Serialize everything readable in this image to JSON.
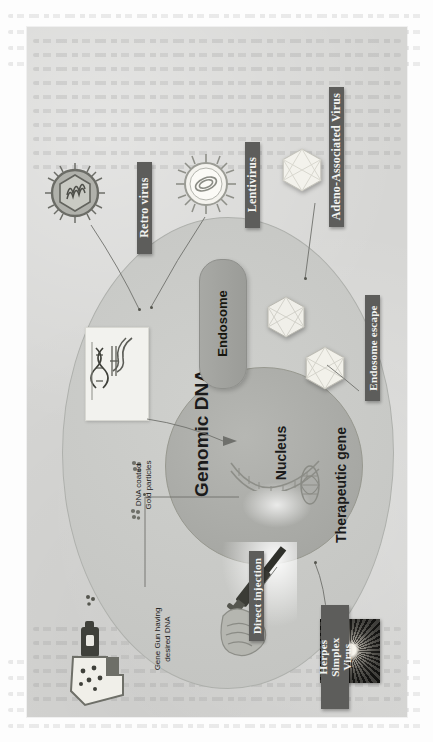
{
  "figure": {
    "orientation": "rotated-90-ccw",
    "background_note": "scanned book page with faint bleed-through text",
    "colors": {
      "page": "#fdfdfd",
      "panel": "#d6d6d4",
      "cell": "#c8c9c6",
      "nucleus": "#a9aaa6",
      "endosome": "#9b9c98",
      "ribbon": "#5d5d5b",
      "ribbon_text": "#f3f3f1",
      "ink": "#1b1b1b"
    }
  },
  "ribbons": [
    {
      "id": "retro-virus",
      "label": "Retro virus"
    },
    {
      "id": "lentivirus",
      "label": "Lentivirus"
    },
    {
      "id": "adeno-associated-virus",
      "label": "Adeno-Associated Virus"
    },
    {
      "id": "endosome-escape",
      "label": "Endosome escape"
    },
    {
      "id": "direct-injection",
      "label": "Direct injection"
    },
    {
      "id": "herpes-simplex-virus",
      "label": "Herpes Simplex\nVirus"
    }
  ],
  "structures": {
    "endosome": "Endosome",
    "genomic_dna": "Genomic DNA",
    "nucleus": "Nucleus",
    "therapeutic_gene": "Therapeutic gene"
  },
  "captions": {
    "gold_particles": "DNA coated\nGold particles",
    "gene_gun": "Gene Gun having\ndesired  DNA"
  },
  "icons": {
    "retro_virus": "spiked-enveloped-virion-icon",
    "lentivirus": "spiked-virion-icon",
    "aav_capsid": "icosahedral-capsid-icon",
    "endosome_capsid": "icosahedral-capsid-icon",
    "escaped_capsid": "icosahedral-capsid-icon",
    "gene_gun": "gene-gun-icon",
    "syringe": "syringe-hand-icon",
    "hsv_micrograph": "herpes-virion-micrograph-icon",
    "plasmid_panel": "plasmid-dna-panel-icon",
    "gold_particle": "gold-particle-icon",
    "therapeutic_gene_helix": "dna-helix-icon",
    "genomic_dna_helix": "dna-helix-icon"
  }
}
